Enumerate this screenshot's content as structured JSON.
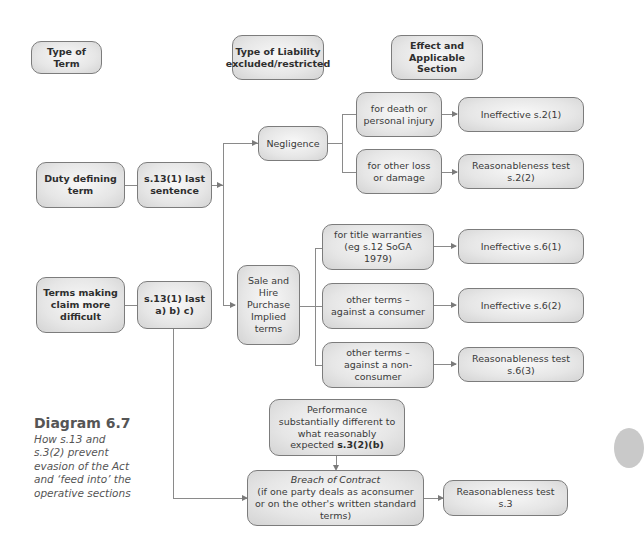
{
  "headers": {
    "type_of_term": "Type of Term",
    "type_of_liability": "Type of Liability excluded/restricted",
    "effect": "Effect and Applicable Section"
  },
  "terms": {
    "duty_defining": "Duty defining term",
    "duty_defining_section": "s.13(1) last sentence",
    "claim_difficult": "Terms making claim more difficult",
    "claim_difficult_section": "s.13(1) last a) b) c)"
  },
  "liability": {
    "negligence": "Negligence",
    "sale_hire": "Sale and Hire Purchase Implied terms",
    "death_injury": "for death or personal injury",
    "other_loss": "for other loss or damage",
    "title_warranties": "for title warranties (eg s.12 SoGA 1979)",
    "against_consumer": "other terms – against a consumer",
    "against_nonconsumer": "other terms – against a non-consumer",
    "performance_prefix": "Performance substantially different to what reasonably expected ",
    "performance_section": "s.3(2)(b)",
    "breach_title": "Breach of Contract",
    "breach_detail": "(if one party deals as aconsumer or on the other's written standard terms)"
  },
  "effects": {
    "s2_1": "Ineffective s.2(1)",
    "s2_2": "Reasonableness test s.2(2)",
    "s6_1": "Ineffective s.6(1)",
    "s6_2": "Ineffective s.6(2)",
    "s6_3": "Reasonableness test s.6(3)",
    "s3": "Reasonableness test s.3"
  },
  "caption": {
    "title": "Diagram 6.7",
    "text": "How s.13 and s.3(2) prevent evasion of the Act and ‘feed into’ the operative sections"
  },
  "colors": {
    "box_fill": "#e6e6e6",
    "box_border": "#7c7c7c",
    "connector": "#8a8a8a"
  }
}
